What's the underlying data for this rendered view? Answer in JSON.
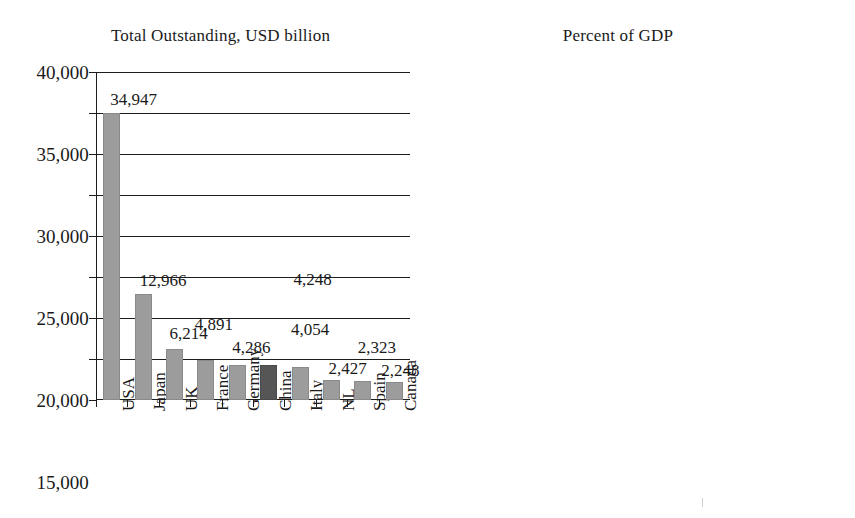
{
  "figure": {
    "background": "#ffffff",
    "bar_color": "#9c9c9c",
    "highlight_color": "#565656",
    "highlight_category": "China"
  },
  "chart_data": [
    {
      "type": "bar",
      "title": "Total Outstanding, USD billion",
      "xlabel": "",
      "ylabel": "",
      "ylim": [
        0,
        40000
      ],
      "yticks": [
        0,
        5000,
        10000,
        15000,
        20000,
        25000,
        30000,
        35000,
        40000
      ],
      "ytick_labels": [
        "0",
        "5,000",
        "10,000",
        "15,000",
        "20,000",
        "25,000",
        "30,000",
        "35,000",
        "40,000"
      ],
      "grid": true,
      "legend": "none",
      "categories": [
        "USA",
        "Japan",
        "UK",
        "France",
        "Germany",
        "China",
        "Italy",
        "NL",
        "Spain",
        "Canada"
      ],
      "values": [
        34947,
        12966,
        6214,
        4891,
        4286,
        4248,
        4054,
        2427,
        2323,
        2248
      ],
      "data_labels": [
        "34,947",
        "12,966",
        "6,214",
        "4,891",
        "4,286",
        "4,248",
        "4,054",
        "2,427",
        "2,323",
        "2,248"
      ],
      "highlighted": [
        "China"
      ]
    },
    {
      "type": "bar",
      "title": "Percent of GDP",
      "xlabel": "",
      "ylabel": "",
      "ylim": [
        0,
        300
      ],
      "yticks": [
        0,
        50,
        100,
        150,
        200,
        250,
        300
      ],
      "ytick_labels": [
        "0",
        "50",
        "100",
        "150",
        "200",
        "250",
        "300"
      ],
      "grid": true,
      "legend": "none",
      "categories": [
        "NL",
        "Japan",
        "UK",
        "USA",
        "Italy",
        "France",
        "Spain",
        "Canada",
        "Germany",
        "China"
      ],
      "values": [
        276,
        272,
        207,
        197,
        189,
        178,
        168,
        125,
        112,
        41
      ],
      "data_labels": [
        "276",
        "272",
        "207",
        "197",
        "189",
        "178",
        "168",
        "125",
        "112",
        "41"
      ],
      "highlighted": [
        "China"
      ]
    }
  ]
}
